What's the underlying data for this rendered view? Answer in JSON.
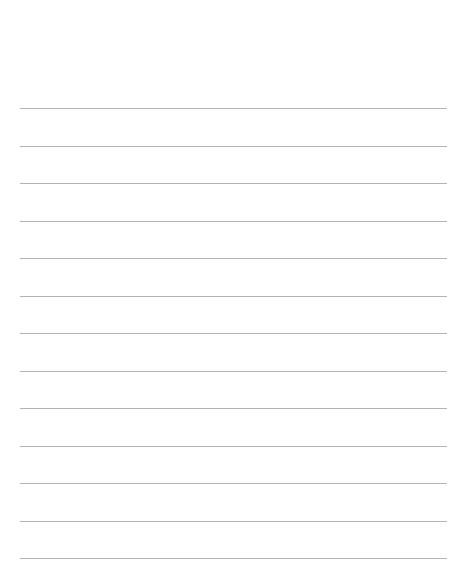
{
  "page": {
    "type": "lined-paper",
    "line_color": "#b4b4b4",
    "background": "#ffffff",
    "line_count": 13,
    "lines_y": [
      108,
      146,
      183,
      221,
      258,
      296,
      333,
      371,
      408,
      446,
      483,
      521,
      558
    ]
  }
}
